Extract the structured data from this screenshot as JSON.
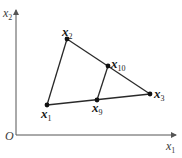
{
  "diagram": {
    "axes": {
      "origin_label": "O",
      "x_axis": {
        "var": "x",
        "sub": "1"
      },
      "y_axis": {
        "var": "x",
        "sub": "2"
      }
    },
    "points": [
      {
        "id": "x1",
        "var": "x",
        "sub": "1",
        "pos": [
          47,
          105
        ]
      },
      {
        "id": "x2",
        "var": "x",
        "sub": "2",
        "pos": [
          67,
          39
        ]
      },
      {
        "id": "x3",
        "var": "x",
        "sub": "3",
        "pos": [
          150,
          94
        ]
      },
      {
        "id": "x9",
        "var": "x",
        "sub": "9",
        "pos": [
          97,
          100
        ]
      },
      {
        "id": "x10",
        "var": "x",
        "sub": "10",
        "pos": [
          108,
          66
        ]
      }
    ],
    "edges": [
      [
        "x1",
        "x2"
      ],
      [
        "x2",
        "x3"
      ],
      [
        "x1",
        "x3"
      ],
      [
        "x9",
        "x10"
      ]
    ],
    "colors": {
      "line": "#2a2a2a",
      "point": "#111111",
      "axis": "#555555"
    }
  }
}
